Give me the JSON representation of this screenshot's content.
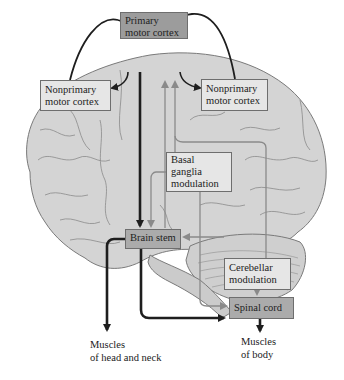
{
  "diagram": {
    "type": "motor-control-pathway",
    "nodes": {
      "primary_motor_cortex": {
        "line1": "Primary",
        "line2": "motor cortex"
      },
      "nonprimary_left": {
        "line1": "Nonprimary",
        "line2": "motor cortex"
      },
      "nonprimary_right": {
        "line1": "Nonprimary",
        "line2": "motor cortex"
      },
      "basal_ganglia": {
        "line1": "Basal",
        "line2": "ganglia",
        "line3": "modulation"
      },
      "brain_stem": {
        "line1": "Brain stem"
      },
      "cerebellar": {
        "line1": "Cerebellar",
        "line2": "modulation"
      },
      "spinal_cord": {
        "line1": "Spinal cord"
      }
    },
    "outputs": {
      "head_neck": {
        "line1": "Muscles",
        "line2": "of head and neck"
      },
      "body": {
        "line1": "Muscles",
        "line2": "of body"
      }
    },
    "edges": [
      {
        "from": "nonprimary_left",
        "to": "primary_motor_cortex",
        "style": "dark-curved"
      },
      {
        "from": "nonprimary_right",
        "to": "primary_motor_cortex",
        "style": "dark-curved"
      },
      {
        "from": "primary_motor_cortex",
        "to": "nonprimary_left",
        "style": "dark-curved"
      },
      {
        "from": "primary_motor_cortex",
        "to": "nonprimary_right",
        "style": "dark-curved"
      },
      {
        "from": "primary_motor_cortex",
        "to": "brain_stem",
        "style": "dark-thick"
      },
      {
        "from": "basal_ganglia",
        "to": "primary_motor_cortex",
        "style": "gray"
      },
      {
        "from": "cerebellar",
        "to": "primary_motor_cortex",
        "style": "gray"
      },
      {
        "from": "basal_ganglia",
        "to": "brain_stem",
        "style": "gray"
      },
      {
        "from": "cerebellar",
        "to": "brain_stem",
        "style": "gray"
      },
      {
        "from": "basal_ganglia",
        "to": "spinal_cord",
        "style": "gray"
      },
      {
        "from": "cerebellar",
        "to": "spinal_cord",
        "style": "gray"
      },
      {
        "from": "brain_stem",
        "to": "spinal_cord",
        "style": "dark-thick"
      },
      {
        "from": "brain_stem",
        "to": "head_neck",
        "style": "dark-thick"
      },
      {
        "from": "spinal_cord",
        "to": "body",
        "style": "dark-thick"
      }
    ],
    "colors": {
      "brain_fill": "#d4d4d4",
      "brain_outline": "#7a7a7a",
      "dark_arrow": "#1e1e1e",
      "gray_arrow": "#8a8a8a",
      "box_light": "#e6e6e6",
      "box_dark": "#9c9c9c"
    }
  }
}
